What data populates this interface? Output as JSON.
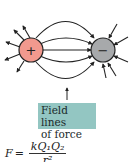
{
  "diagram": {
    "positive_charge": {
      "symbol": "+",
      "color": "#f1998e"
    },
    "negative_charge": {
      "symbol": "−",
      "color": "#a7a9ab"
    },
    "line_color": "#222222"
  },
  "label": {
    "line1": "Field lines",
    "line2": "of force",
    "background": "#93c6c2"
  },
  "formula": {
    "lhs": "F",
    "equals": "=",
    "numerator": "kQ₁Q₂",
    "denominator": "r²"
  }
}
